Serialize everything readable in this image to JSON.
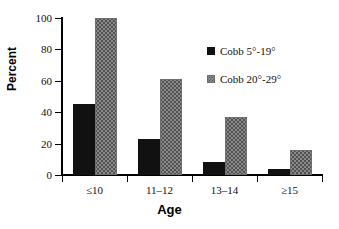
{
  "chart_data": {
    "type": "bar",
    "title": "",
    "xlabel": "Age",
    "ylabel": "Percent",
    "categories": [
      "≤10",
      "11–12",
      "13–14",
      "≥15"
    ],
    "series": [
      {
        "name": "Cobb 5°-19°",
        "color": "#111111",
        "values": [
          45,
          23,
          8,
          4
        ]
      },
      {
        "name": "Cobb 20°-29°",
        "color": "#8a8a8a",
        "values": [
          100,
          61,
          37,
          16
        ]
      }
    ],
    "ylim": [
      0,
      100
    ],
    "yticks": [
      0,
      20,
      40,
      60,
      80,
      100
    ],
    "ytick_labels": [
      "0",
      "20",
      "40",
      "60",
      "80",
      "100"
    ],
    "grid": false,
    "legend_position": "upper right"
  }
}
